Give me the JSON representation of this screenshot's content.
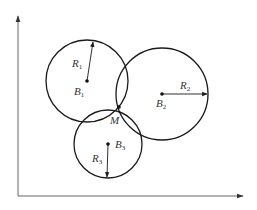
{
  "diagram": {
    "type": "trilateration",
    "colors": {
      "stroke": "#1a1a1a",
      "axis": "#555555",
      "label": "#333333"
    },
    "axes": {
      "origin": [
        18,
        196
      ],
      "x_end": [
        244,
        196
      ],
      "y_end": [
        18,
        15
      ]
    },
    "circles": [
      {
        "id": "circle-1",
        "center": [
          87,
          81
        ],
        "radius": 41,
        "center_label": "B",
        "center_sub": "1",
        "radius_label": "R",
        "radius_sub": "1",
        "radius_end": [
          93,
          41
        ]
      },
      {
        "id": "circle-2",
        "center": [
          162,
          94
        ],
        "radius": 46,
        "center_label": "B",
        "center_sub": "2",
        "radius_label": "R",
        "radius_sub": "2",
        "radius_end": [
          207,
          94
        ]
      },
      {
        "id": "circle-3",
        "center": [
          108,
          144
        ],
        "radius": 34,
        "center_label": "B",
        "center_sub": "3",
        "radius_label": "R",
        "radius_sub": "3",
        "radius_end": [
          107,
          177
        ]
      }
    ],
    "intersection": {
      "label": "M",
      "point": [
        119,
        107
      ]
    }
  }
}
